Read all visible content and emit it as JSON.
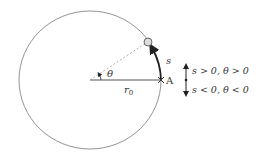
{
  "diagram": {
    "type": "circular-motion",
    "circle": {
      "cx": 90,
      "cy": 80,
      "r": 71
    },
    "labels": {
      "arc": "s",
      "angle": "θ",
      "radius": "r",
      "radius_sub": "0",
      "point": "A",
      "positive": "s > 0,  θ > 0",
      "negative": "s < 0,  θ < 0"
    },
    "colors": {
      "line": "#555555",
      "arc_arrow": "#222222",
      "ball_fill": "#dddddd",
      "ball_stroke": "#555555",
      "text": "#333333"
    }
  }
}
